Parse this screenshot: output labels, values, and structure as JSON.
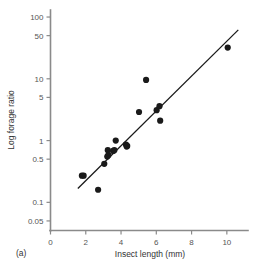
{
  "figure": {
    "panel_label": "(a)",
    "background_color": "#ffffff",
    "axis_color": "#8a8a8a",
    "ink_color": "#1a1a1a"
  },
  "chart_data": {
    "type": "scatter",
    "title": "",
    "subtitle": "",
    "xlabel": "Insect length (mm)",
    "ylabel": "Log forage ratio",
    "panel_label": "(a)",
    "xscale": "linear",
    "yscale": "log",
    "xlim": [
      0,
      11.2
    ],
    "ylim": [
      0.035,
      130
    ],
    "grid": false,
    "legend": null,
    "xticks": [
      0,
      2,
      4,
      6,
      8,
      10
    ],
    "xticklabels": [
      "0",
      "2",
      "4",
      "6",
      "8",
      "10"
    ],
    "yticks": [
      0.05,
      0.1,
      0.5,
      1,
      5,
      10,
      50,
      100
    ],
    "yticklabels": [
      "0.05",
      "0.1",
      "0.5",
      "1",
      "5",
      "10",
      "50",
      "100"
    ],
    "marker": "filled-circle",
    "marker_color": "#1a1a1a",
    "points": [
      {
        "x": 1.78,
        "y": 0.27
      },
      {
        "x": 1.88,
        "y": 0.27
      },
      {
        "x": 2.7,
        "y": 0.16
      },
      {
        "x": 3.05,
        "y": 0.42
      },
      {
        "x": 3.22,
        "y": 0.55
      },
      {
        "x": 3.25,
        "y": 0.7
      },
      {
        "x": 3.28,
        "y": 0.58
      },
      {
        "x": 3.55,
        "y": 0.68
      },
      {
        "x": 3.62,
        "y": 0.7
      },
      {
        "x": 3.7,
        "y": 1.0
      },
      {
        "x": 4.28,
        "y": 0.86
      },
      {
        "x": 4.32,
        "y": 0.8
      },
      {
        "x": 4.35,
        "y": 0.82
      },
      {
        "x": 5.02,
        "y": 2.9
      },
      {
        "x": 5.42,
        "y": 9.6
      },
      {
        "x": 6.02,
        "y": 3.1
      },
      {
        "x": 6.18,
        "y": 3.6
      },
      {
        "x": 6.22,
        "y": 2.1
      },
      {
        "x": 10.05,
        "y": 32.0
      }
    ],
    "fit_line": {
      "label": "regression line",
      "x_start": 1.55,
      "y_start": 0.168,
      "x_end": 10.65,
      "y_end": 62.0,
      "color": "#1a1a1a"
    }
  }
}
